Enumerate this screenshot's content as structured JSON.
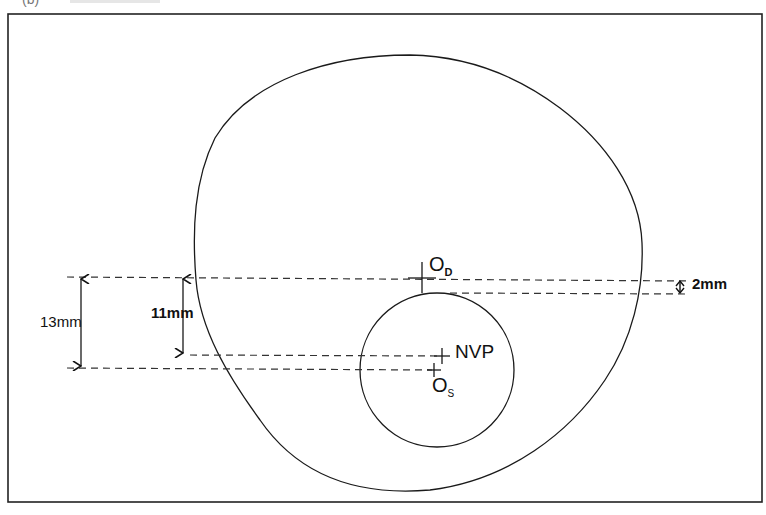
{
  "figure": {
    "caption_partial": "(b)",
    "labels": {
      "distance_center": {
        "main": "O",
        "sub": "D"
      },
      "near_center": {
        "main": "O",
        "sub": "S"
      },
      "near_visual_point": "NVP"
    },
    "dimensions": {
      "total_drop": "13mm",
      "nvp_drop": "11mm",
      "segment_offset": "2mm"
    },
    "line_color": "#1a1a1a",
    "background": "#ffffff"
  }
}
